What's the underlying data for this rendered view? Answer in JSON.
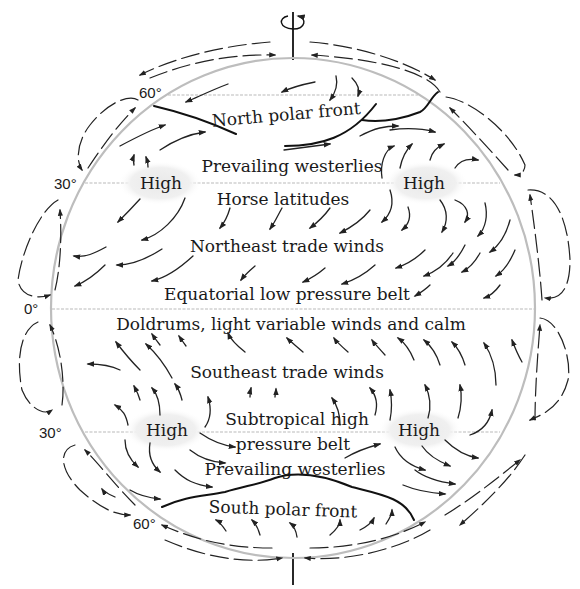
{
  "colors": {
    "globe_outline": "#bdbdbd",
    "latitude_lines": "#b9b9b9",
    "ink": "#1a1a1a",
    "high_pressure_halo": "#eeeeee"
  },
  "latitudes": {
    "north_60": "60°",
    "north_30": "30°",
    "equator": "0°",
    "south_30": "30°",
    "south_60": "60°"
  },
  "zones": {
    "north_polar_front": "North polar front",
    "north_westerlies": "Prevailing westerlies",
    "horse_latitudes": "Horse latitudes",
    "northeast_trades": "Northeast trade winds",
    "equatorial_low": "Equatorial low pressure belt",
    "doldrums": "Doldrums, light variable winds and calm",
    "southeast_trades": "Southeast trade winds",
    "subtropical_high_1": "Subtropical high",
    "subtropical_high_2": "pressure belt",
    "south_westerlies": "Prevailing westerlies",
    "south_polar_front": "South polar front"
  },
  "pressure_centers": {
    "north_west": "High",
    "north_east": "High",
    "south_west": "High",
    "south_east": "High"
  },
  "icons": {
    "rotation": "earth-rotation-arrow",
    "axis": "earth-axis"
  }
}
